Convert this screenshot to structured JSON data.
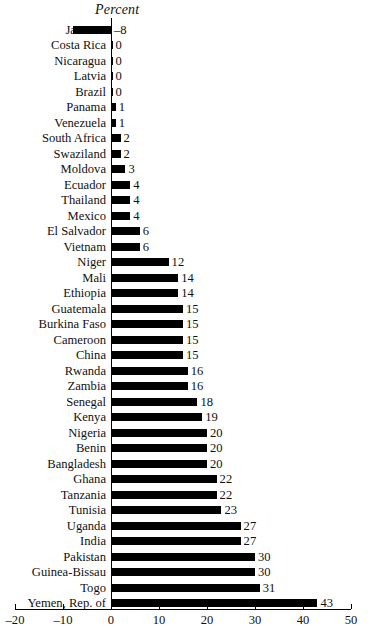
{
  "chart_data": {
    "type": "bar",
    "orientation": "horizontal",
    "title": "Percent",
    "xlabel": "",
    "ylabel": "",
    "xlim": [
      -20,
      50
    ],
    "xticks": [
      -20,
      -10,
      0,
      10,
      20,
      30,
      40,
      50
    ],
    "xtick_labels": [
      "–20",
      "–10",
      "0",
      "10",
      "20",
      "30",
      "40",
      "50"
    ],
    "grid": false,
    "legend": null,
    "bar_color": "#000000",
    "categories": [
      "Jamaica",
      "Costa Rica",
      "Nicaragua",
      "Latvia",
      "Brazil",
      "Panama",
      "Venezuela",
      "South Africa",
      "Swaziland",
      "Moldova",
      "Ecuador",
      "Thailand",
      "Mexico",
      "El Salvador",
      "Vietnam",
      "Niger",
      "Mali",
      "Ethiopia",
      "Guatemala",
      "Burkina Faso",
      "Cameroon",
      "China",
      "Rwanda",
      "Zambia",
      "Senegal",
      "Kenya",
      "Nigeria",
      "Benin",
      "Bangladesh",
      "Ghana",
      "Tanzania",
      "Tunisia",
      "Uganda",
      "India",
      "Pakistan",
      "Guinea-Bissau",
      "Togo",
      "Yemen, Rep. of"
    ],
    "values": [
      -8,
      0,
      0,
      0,
      0,
      1,
      1,
      2,
      2,
      3,
      4,
      4,
      4,
      6,
      6,
      12,
      14,
      14,
      15,
      15,
      15,
      15,
      16,
      16,
      18,
      19,
      20,
      20,
      20,
      22,
      22,
      23,
      27,
      27,
      30,
      30,
      31,
      43
    ],
    "value_labels": [
      "–8",
      "0",
      "0",
      "0",
      "0",
      "1",
      "1",
      "2",
      "2",
      "3",
      "4",
      "4",
      "4",
      "6",
      "6",
      "12",
      "14",
      "14",
      "15",
      "15",
      "15",
      "15",
      "16",
      "16",
      "18",
      "19",
      "20",
      "20",
      "20",
      "22",
      "22",
      "23",
      "27",
      "27",
      "30",
      "30",
      "31",
      "43"
    ]
  }
}
